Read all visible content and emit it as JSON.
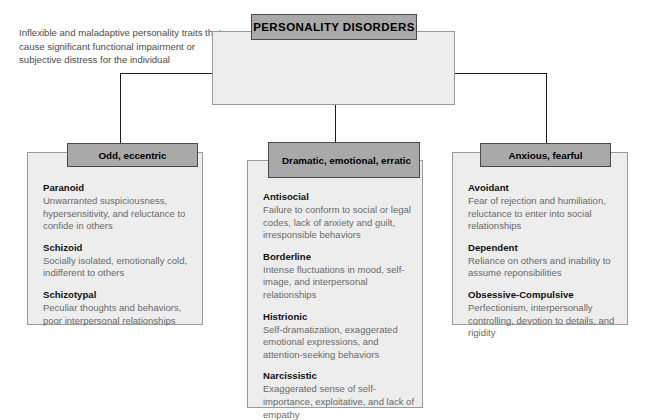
{
  "root": {
    "title": "PERSONALITY DISORDERS",
    "description": "Inflexible and maladaptive personality traits that cause significant functional impairment or subjective distress for the individual"
  },
  "colors": {
    "header_fill": "#a9a9a9",
    "panel_fill": "#ededed",
    "panel_border": "#9a9a9a",
    "header_border": "#4a4a4a",
    "connector": "#1a1a1a",
    "body_text": "#6a6a6a",
    "name_text": "#111111"
  },
  "clusters": [
    {
      "header": "Odd, eccentric",
      "entries": [
        {
          "name": "Paranoid",
          "description": "Unwarranted suspiciousness, hypersensitivity, and reluctance to confide in others"
        },
        {
          "name": "Schizoid",
          "description": "Socially isolated, emotionally cold, indifferent to others"
        },
        {
          "name": "Schizotypal",
          "description": "Peculiar thoughts and behaviors, poor interpersonal relationships"
        }
      ]
    },
    {
      "header": "Dramatic, emotional, erratic",
      "entries": [
        {
          "name": "Antisocial",
          "description": "Failure to conform to social or legal codes, lack of anxiety and guilt, irresponsible behaviors"
        },
        {
          "name": "Borderline",
          "description": "Intense fluctuations in mood, self-image, and interpersonal relationships"
        },
        {
          "name": "Histrionic",
          "description": "Self-dramatization, exaggerated emotional expressions, and attention-seeking behaviors"
        },
        {
          "name": "Narcissistic",
          "description": "Exaggerated sense of self-importance, exploitative, and lack of empathy"
        }
      ]
    },
    {
      "header": "Anxious, fearful",
      "entries": [
        {
          "name": "Avoidant",
          "description": "Fear of rejection and humiliation, reluctance to enter into social relationships"
        },
        {
          "name": "Dependent",
          "description": "Reliance on others and inability to assume reponsibilities"
        },
        {
          "name": "Obsessive-Compulsive",
          "description": "Perfectionism, interpersonally controlling, devotion to details, and rigidity"
        }
      ]
    }
  ]
}
